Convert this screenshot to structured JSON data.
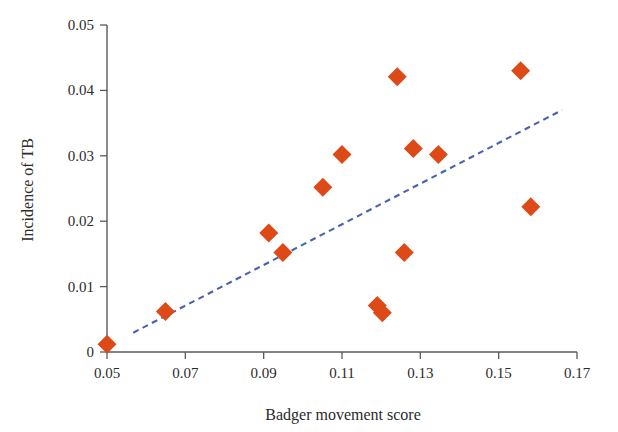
{
  "chart_data": {
    "type": "scatter",
    "title": "",
    "xlabel": "Badger movement score",
    "ylabel": "Incidence of TB",
    "xlim": [
      0.05,
      0.17
    ],
    "ylim": [
      0,
      0.05
    ],
    "grid": false,
    "legend": "none",
    "marker_shape": "diamond",
    "marker_color": "#dd4a18",
    "trend_line": {
      "style": "dashed",
      "color": "#4a62ad",
      "x_start": 0.0567,
      "y_start": 0.00295,
      "x_end": 0.1662,
      "y_end": 0.037
    },
    "xticks": [
      "0.05",
      "0.07",
      "0.09",
      "0.11",
      "0.13",
      "0.15",
      "0.17"
    ],
    "xtick_values": [
      0.05,
      0.07,
      0.09,
      0.11,
      0.13,
      0.15,
      0.17
    ],
    "yticks": [
      "0",
      "0.01",
      "0.02",
      "0.03",
      "0.04",
      "0.05"
    ],
    "ytick_values": [
      0,
      0.01,
      0.02,
      0.03,
      0.04,
      0.05
    ],
    "points": [
      {
        "x": 0.05,
        "y": 0.0012
      },
      {
        "x": 0.0649,
        "y": 0.0062
      },
      {
        "x": 0.0913,
        "y": 0.0182
      },
      {
        "x": 0.0949,
        "y": 0.0152
      },
      {
        "x": 0.1051,
        "y": 0.0252
      },
      {
        "x": 0.11,
        "y": 0.0302
      },
      {
        "x": 0.119,
        "y": 0.0071
      },
      {
        "x": 0.1203,
        "y": 0.006
      },
      {
        "x": 0.1241,
        "y": 0.0421
      },
      {
        "x": 0.1259,
        "y": 0.0152
      },
      {
        "x": 0.1282,
        "y": 0.0311
      },
      {
        "x": 0.1346,
        "y": 0.0302
      },
      {
        "x": 0.1556,
        "y": 0.043
      },
      {
        "x": 0.1582,
        "y": 0.0222
      }
    ]
  }
}
